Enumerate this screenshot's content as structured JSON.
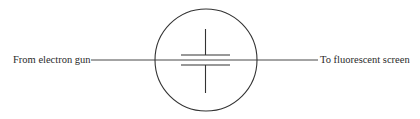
{
  "diagram": {
    "type": "cathode-ray deflection plates cross-section",
    "labels": {
      "input": "From electron gun",
      "output": "To fluorescent screen"
    },
    "components": {
      "tube_envelope": "circle",
      "deflection_plates": [
        "upper plate",
        "lower plate"
      ],
      "beam": "horizontal line through plates"
    },
    "colors": {
      "stroke": "#333333",
      "text": "#2a2a2a",
      "background": "#ffffff"
    }
  }
}
